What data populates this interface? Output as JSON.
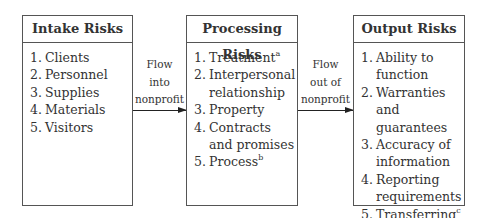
{
  "diagram": {
    "boxes": [
      {
        "title": "Intake Risks",
        "items": [
          {
            "num": "1.",
            "text": "Clients",
            "sup": ""
          },
          {
            "num": "2.",
            "text": "Personnel",
            "sup": ""
          },
          {
            "num": "3.",
            "text": "Supplies",
            "sup": ""
          },
          {
            "num": "4.",
            "text": "Materials",
            "sup": ""
          },
          {
            "num": "5.",
            "text": "Visitors",
            "sup": ""
          }
        ]
      },
      {
        "title": "Processing Risks",
        "items": [
          {
            "num": "1.",
            "text": "Treatment",
            "sup": "a"
          },
          {
            "num": "2.",
            "text": "Interpersonal relationship",
            "sup": ""
          },
          {
            "num": "3.",
            "text": "Property",
            "sup": ""
          },
          {
            "num": "4.",
            "text": "Contracts and promises",
            "sup": ""
          },
          {
            "num": "5.",
            "text": "Process",
            "sup": "b"
          }
        ]
      },
      {
        "title": "Output Risks",
        "items": [
          {
            "num": "1.",
            "text": "Ability to function",
            "sup": ""
          },
          {
            "num": "2.",
            "text": "Warranties and guarantees",
            "sup": ""
          },
          {
            "num": "3.",
            "text": "Accuracy of information",
            "sup": ""
          },
          {
            "num": "4.",
            "text": "Reporting requirements",
            "sup": ""
          },
          {
            "num": "5.",
            "text": "Transferring",
            "sup": "c"
          }
        ]
      }
    ],
    "flows": [
      {
        "lines": [
          "Flow",
          "into",
          "nonprofit"
        ]
      },
      {
        "lines": [
          "Flow",
          "out of",
          "nonprofit"
        ]
      }
    ]
  }
}
